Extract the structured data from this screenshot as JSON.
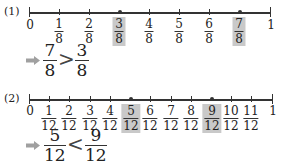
{
  "problem1": {
    "label": "(1)",
    "start": "0",
    "end": "1",
    "denominator": "8",
    "ticks": [
      {
        "num": "1",
        "den": "8",
        "highlight": false
      },
      {
        "num": "2",
        "den": "8",
        "highlight": false
      },
      {
        "num": "3",
        "den": "8",
        "highlight": true
      },
      {
        "num": "4",
        "den": "8",
        "highlight": false
      },
      {
        "num": "5",
        "den": "8",
        "highlight": false
      },
      {
        "num": "6",
        "den": "8",
        "highlight": false
      },
      {
        "num": "7",
        "den": "8",
        "highlight": true
      }
    ],
    "comparison": {
      "left": {
        "num": "7",
        "den": "8"
      },
      "symbol": ">",
      "right": {
        "num": "3",
        "den": "8"
      }
    }
  },
  "problem2": {
    "label": "(2)",
    "start": "0",
    "end": "1",
    "denominator": "12",
    "ticks": [
      {
        "num": "1",
        "den": "12",
        "highlight": false
      },
      {
        "num": "2",
        "den": "12",
        "highlight": false
      },
      {
        "num": "3",
        "den": "12",
        "highlight": false
      },
      {
        "num": "4",
        "den": "12",
        "highlight": false
      },
      {
        "num": "5",
        "den": "12",
        "highlight": true
      },
      {
        "num": "6",
        "den": "12",
        "highlight": false
      },
      {
        "num": "7",
        "den": "12",
        "highlight": false
      },
      {
        "num": "8",
        "den": "12",
        "highlight": false
      },
      {
        "num": "9",
        "den": "12",
        "highlight": true
      },
      {
        "num": "10",
        "den": "12",
        "highlight": false
      },
      {
        "num": "11",
        "den": "12",
        "highlight": false
      }
    ],
    "comparison": {
      "left": {
        "num": "5",
        "den": "12"
      },
      "symbol": "<",
      "right": {
        "num": "9",
        "den": "12"
      }
    }
  },
  "colors": {
    "highlight": "#c9c9c9",
    "arrow": "#a0a0a0",
    "line": "#333333"
  }
}
